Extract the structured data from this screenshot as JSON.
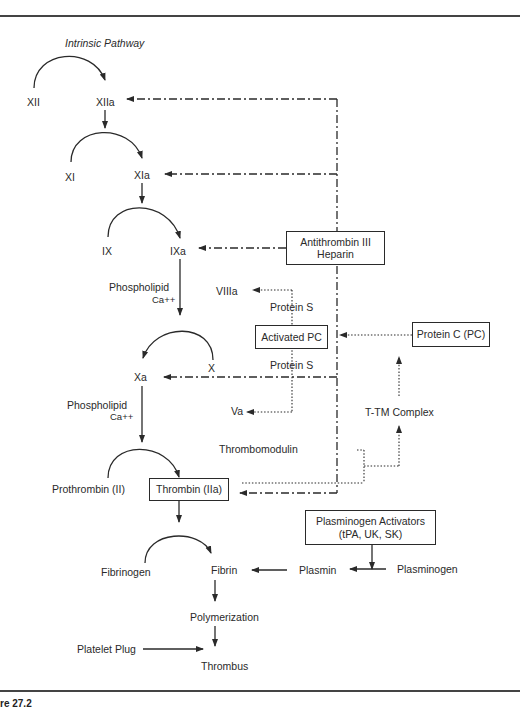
{
  "diagram": {
    "title": "Intrinsic Pathway",
    "caption": "re 27.2",
    "nodes": {
      "xii": "XII",
      "xiia": "XIIa",
      "xi": "XI",
      "xia": "XIa",
      "ix": "IX",
      "ixa": "IXa",
      "phospholipid1": "Phospholipid",
      "ca1": "Ca++",
      "x": "X",
      "xa": "Xa",
      "phospholipid2": "Phospholipid",
      "ca2": "Ca++",
      "prothrombin": "Prothrombin (II)",
      "thrombin": "Thrombin (IIa)",
      "fibrinogen": "Fibrinogen",
      "fibrin": "Fibrin",
      "polymerization": "Polymerization",
      "platelet_plug": "Platelet Plug",
      "thrombus": "Thrombus",
      "antithrombin_line1": "Antithrombin III",
      "antithrombin_line2": "Heparin",
      "viiia": "VIIIa",
      "protein_s_top": "Protein S",
      "activated_pc": "Activated PC",
      "protein_s_bottom": "Protein S",
      "va": "Va",
      "protein_c": "Protein C (PC)",
      "ttm_complex": "T-TM Complex",
      "thrombomodulin": "Thrombomodulin",
      "plasminogen_activators_line1": "Plasminogen Activators",
      "plasminogen_activators_line2": "(tPA, UK, SK)",
      "plasmin": "Plasmin",
      "plasminogen": "Plasminogen"
    },
    "edge_styles": {
      "activation": "solid",
      "inhibition_antithrombin": "dash-dot",
      "protein_c_pathway": "dotted"
    },
    "colors": {
      "ink": "#2a2a2a",
      "background": "#ffffff"
    }
  }
}
